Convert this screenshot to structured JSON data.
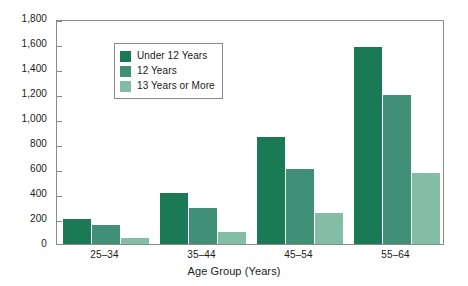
{
  "chart_data": {
    "type": "bar",
    "title": "",
    "subtitle": "",
    "xlabel": "Age Group (Years)",
    "ylabel": "",
    "categories": [
      "25–34",
      "35–44",
      "45–54",
      "55–64"
    ],
    "series": [
      {
        "name": "Under 12 Years",
        "color": "#1a7a56",
        "values": [
          200,
          410,
          855,
          1580
        ]
      },
      {
        "name": "12 Years",
        "color": "#3f9077",
        "values": [
          155,
          285,
          600,
          1195
        ]
      },
      {
        "name": "13 Years or More",
        "color": "#84bda6",
        "values": [
          50,
          100,
          245,
          570
        ]
      }
    ],
    "ylim": [
      0,
      1800
    ],
    "ytick_step": 200,
    "ytick_labels": [
      "0",
      "200",
      "400",
      "600",
      "800",
      "1,000",
      "1,200",
      "1,400",
      "1,600",
      "1,800"
    ],
    "ytick_values": [
      0,
      200,
      400,
      600,
      800,
      1000,
      1200,
      1400,
      1600,
      1800
    ],
    "grid": false,
    "legend_position": "top-left",
    "frame": true,
    "axis_color": "#8a8a8a",
    "text_color": "#1a1a1a",
    "background": "#ffffff"
  },
  "legend": {
    "entries": [
      {
        "label": "Under 12 Years"
      },
      {
        "label": "12 Years"
      },
      {
        "label": "13 Years or More"
      }
    ]
  }
}
